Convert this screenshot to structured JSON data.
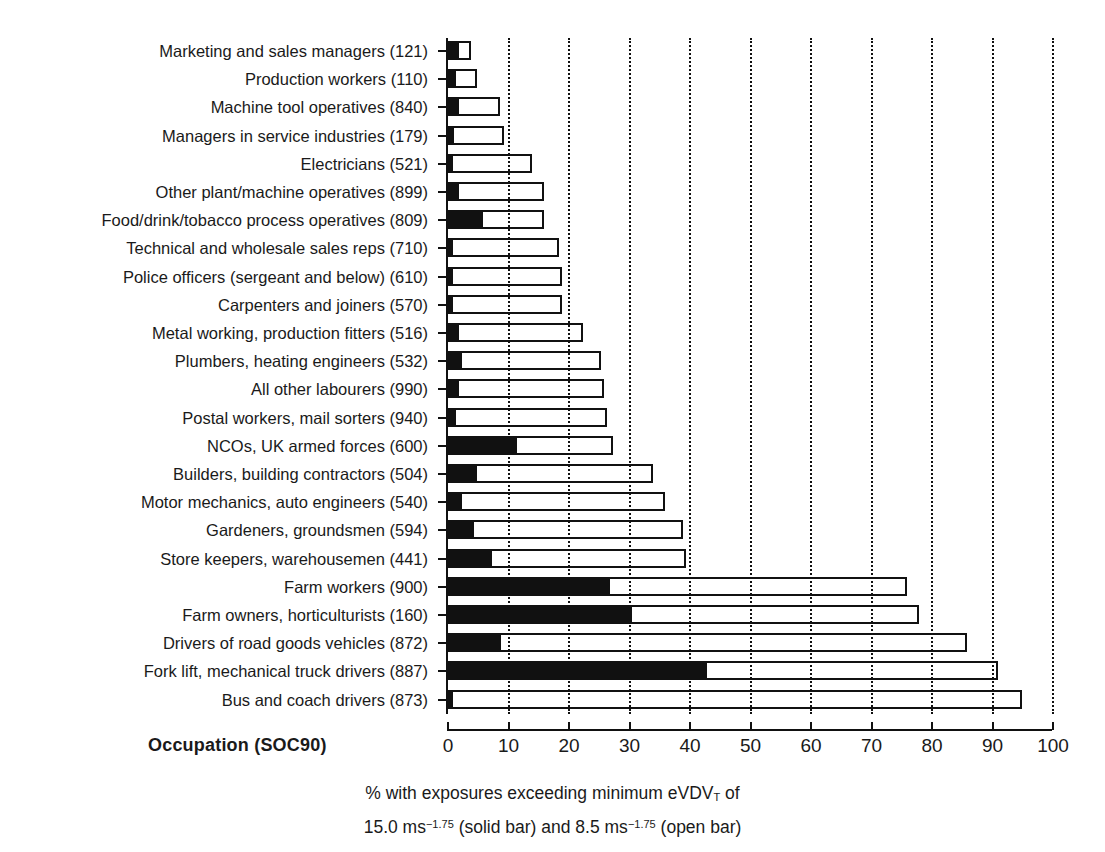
{
  "chart_data": {
    "type": "bar",
    "orientation": "horizontal",
    "title": "",
    "xlabel_lines": [
      "% with exposures exceeding minimum eVDVT of",
      "15.0 ms−1.75 (solid bar) and 8.5 ms−1.75 (open bar)"
    ],
    "ylabel": "Occupation (SOC90)",
    "xlim": [
      0,
      100
    ],
    "xticks": [
      0,
      10,
      20,
      30,
      40,
      50,
      60,
      70,
      80,
      90,
      100
    ],
    "xticklabels": [
      "0",
      "10",
      "20",
      "30",
      "40",
      "50",
      "60",
      "70",
      "80",
      "90",
      "100"
    ],
    "grid": "vertical dotted at every 10 units",
    "legend": "encoded in axis title: solid bar = 15.0 ms^-1.75, open bar = 8.5 ms^-1.75",
    "categories": [
      "Marketing and sales managers (121)",
      "Production workers (110)",
      "Machine tool operatives (840)",
      "Managers in service industries (179)",
      "Electricians (521)",
      "Other plant/machine operatives (899)",
      "Food/drink/tobacco process operatives (809)",
      "Technical and wholesale sales reps (710)",
      "Police officers (sergeant and below) (610)",
      "Carpenters and joiners (570)",
      "Metal working, production fitters (516)",
      "Plumbers, heating engineers (532)",
      "All other labourers (990)",
      "Postal workers, mail sorters (940)",
      "NCOs, UK armed forces (600)",
      "Builders, building contractors (504)",
      "Motor mechanics, auto engineers (540)",
      "Gardeners, groundsmen (594)",
      "Store keepers, warehousemen (441)",
      "Farm workers (900)",
      "Farm owners, horticulturists (160)",
      "Drivers of road goods vehicles (872)",
      "Fork lift, mechanical truck drivers (887)",
      "Bus and coach drivers (873)"
    ],
    "series": [
      {
        "name": "open bar",
        "description": "% with exposures exceeding 8.5 ms^-1.75",
        "values": [
          4.0,
          5.0,
          8.8,
          9.5,
          14.0,
          16.0,
          16.0,
          18.5,
          19.0,
          19.0,
          22.5,
          25.5,
          26.0,
          26.5,
          27.5,
          34.0,
          36.0,
          39.0,
          39.5,
          76.0,
          78.0,
          86.0,
          91.0,
          95.0
        ]
      },
      {
        "name": "solid bar",
        "description": "% with exposures exceeding 15.0 ms^-1.75",
        "values": [
          2.0,
          1.5,
          2.0,
          1.2,
          1.0,
          2.0,
          6.0,
          1.0,
          1.0,
          1.0,
          2.0,
          2.5,
          2.0,
          1.5,
          11.5,
          5.0,
          2.5,
          4.5,
          7.5,
          27.0,
          30.5,
          9.0,
          43.0,
          1.0
        ]
      }
    ]
  }
}
